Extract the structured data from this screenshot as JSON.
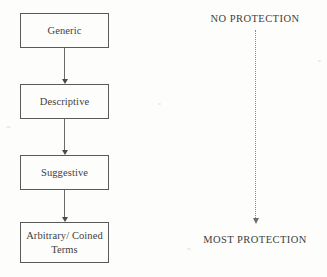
{
  "diagram": {
    "flow": {
      "nodes": [
        {
          "id": "generic",
          "label": "Generic"
        },
        {
          "id": "descriptive",
          "label": "Descriptive"
        },
        {
          "id": "suggestive",
          "label": "Suggestive"
        },
        {
          "id": "arbitrary",
          "label": "Arbitrary/ Coined\nTerms"
        }
      ],
      "connector_count": 3,
      "connector_style": "solid-line-with-arrowhead",
      "direction": "top-to-bottom"
    },
    "gradient_axis": {
      "top_label": "NO PROTECTION",
      "bottom_label": "MOST PROTECTION",
      "arrow_style": "dotted-line-with-arrowhead",
      "direction": "top-to-bottom"
    },
    "colors": {
      "background": "#fdfdfc",
      "box_border": "#5a5a5a",
      "text": "#3d3d3d",
      "connector": "#6a6a6a",
      "dotted_arrow": "#8b8b8b"
    }
  }
}
